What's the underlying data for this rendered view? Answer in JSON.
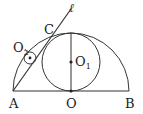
{
  "diagram": {
    "stroke_color": "#333333",
    "points": {
      "A": {
        "label": "A",
        "x": 14,
        "y": 91
      },
      "O": {
        "label": "O",
        "x": 71,
        "y": 91
      },
      "B": {
        "label": "B",
        "x": 130,
        "y": 91
      },
      "C": {
        "label": "C",
        "x": 52,
        "y": 34
      }
    },
    "circles": {
      "O1": {
        "label": "O",
        "sub": "1",
        "cx": 71,
        "cy": 62,
        "r": 29
      },
      "O2": {
        "label": "O",
        "sub": "2",
        "cx": 30,
        "cy": 58,
        "r": 6
      }
    },
    "semicircle": {
      "cx": 71,
      "cy": 91,
      "r": 58
    },
    "line": {
      "label": "ℓ"
    }
  }
}
